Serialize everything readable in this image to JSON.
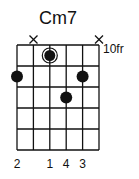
{
  "chord": {
    "name": "Cm7",
    "fret_label": "10fr",
    "strings": 6,
    "frets_shown": 5,
    "muted_strings": [
      2,
      6
    ],
    "root": {
      "string": 3,
      "fret": 1
    },
    "dots": [
      {
        "string": 1,
        "fret": 2
      },
      {
        "string": 5,
        "fret": 2
      },
      {
        "string": 4,
        "fret": 3
      }
    ],
    "fingers": [
      {
        "string": 1,
        "label": "2"
      },
      {
        "string": 3,
        "label": "1"
      },
      {
        "string": 4,
        "label": "4"
      },
      {
        "string": 5,
        "label": "3"
      }
    ],
    "colors": {
      "ink": "#111111",
      "background": "#ffffff"
    }
  }
}
